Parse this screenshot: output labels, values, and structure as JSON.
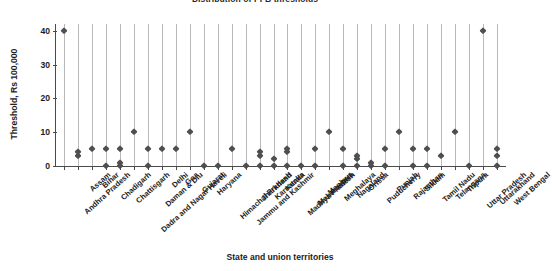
{
  "chart_data": {
    "type": "scatter",
    "title": "Distribution of PFB thresholds",
    "xlabel": "State and union territories",
    "ylabel": "Threshold, Rs 100,000",
    "ylim": [
      0,
      42
    ],
    "yticks": [
      0,
      10,
      20,
      30,
      40
    ],
    "grid": "vertical",
    "legend": "none",
    "marker": "diamond",
    "marker_color": "#4f4f4f",
    "categories": [
      "Andhra Pradesh",
      "Assam",
      "Bihar",
      "Chadigarh",
      "Chattisgarh",
      "Dadra and Nagar Haveli",
      "Daman & Diu",
      "Delhi",
      "Goa",
      "Gujarat",
      "Haryana",
      "Himachal Pradesh",
      "Jammu and Kashmir",
      "Jharkhand",
      "Karnataka",
      "Kerala",
      "Madhya Pradesh",
      "Maharashtra",
      "Manipur",
      "Meghalaya",
      "Nagaland",
      "Orissa",
      "Puducherry",
      "Punjab",
      "Rajasthan",
      "Sikkim",
      "Tamil Nadu",
      "Telangana",
      "Tripura",
      "Uttar Pradesh",
      "Uttarakhand",
      "West Bengal"
    ],
    "points": [
      {
        "category": "Andhra Pradesh",
        "values": [
          40
        ]
      },
      {
        "category": "Assam",
        "values": [
          3,
          4
        ]
      },
      {
        "category": "Bihar",
        "values": [
          5
        ]
      },
      {
        "category": "Chadigarh",
        "values": [
          0,
          5
        ]
      },
      {
        "category": "Chattisgarh",
        "values": [
          0,
          1,
          5
        ]
      },
      {
        "category": "Dadra and Nagar Haveli",
        "values": [
          10
        ]
      },
      {
        "category": "Daman & Diu",
        "values": [
          0,
          5
        ]
      },
      {
        "category": "Delhi",
        "values": [
          5
        ]
      },
      {
        "category": "Goa",
        "values": [
          5
        ]
      },
      {
        "category": "Gujarat",
        "values": [
          10
        ]
      },
      {
        "category": "Haryana",
        "values": [
          0
        ]
      },
      {
        "category": "Himachal Pradesh",
        "values": [
          0
        ]
      },
      {
        "category": "Jammu and Kashmir",
        "values": [
          5
        ]
      },
      {
        "category": "Jharkhand",
        "values": [
          0
        ]
      },
      {
        "category": "Karnataka",
        "values": [
          0,
          3,
          4
        ]
      },
      {
        "category": "Kerala",
        "values": [
          0,
          2
        ]
      },
      {
        "category": "Madhya Pradesh",
        "values": [
          0,
          4,
          5
        ]
      },
      {
        "category": "Maharashtra",
        "values": [
          0
        ]
      },
      {
        "category": "Manipur",
        "values": [
          0,
          5
        ]
      },
      {
        "category": "Meghalaya",
        "values": [
          10
        ]
      },
      {
        "category": "Nagaland",
        "values": [
          0,
          5
        ]
      },
      {
        "category": "Orissa",
        "values": [
          0,
          2,
          3
        ]
      },
      {
        "category": "Puducherry",
        "values": [
          0,
          1
        ]
      },
      {
        "category": "Punjab",
        "values": [
          0,
          5
        ]
      },
      {
        "category": "Rajasthan",
        "values": [
          10
        ]
      },
      {
        "category": "Sikkim",
        "values": [
          0,
          5
        ]
      },
      {
        "category": "Tamil Nadu",
        "values": [
          0,
          5
        ]
      },
      {
        "category": "Telangana",
        "values": [
          3
        ]
      },
      {
        "category": "Tripura",
        "values": [
          10
        ]
      },
      {
        "category": "Uttar Pradesh",
        "values": [
          0
        ]
      },
      {
        "category": "Uttarakhand",
        "values": [
          40
        ]
      },
      {
        "category": "West Bengal",
        "values": [
          0,
          3,
          5
        ]
      }
    ],
    "series_detail": [
      {
        "x": 0,
        "label": "Andhra Pradesh",
        "values": [
          40
        ]
      },
      {
        "x": 1,
        "label": "Assam",
        "values": [
          3,
          4
        ]
      },
      {
        "x": 2,
        "label": "Bihar",
        "values": [
          5
        ]
      },
      {
        "x": 3,
        "label": "Chadigarh",
        "values": [
          0,
          5
        ]
      },
      {
        "x": 4,
        "label": "Chattisgarh",
        "values": [
          0,
          1,
          5
        ]
      },
      {
        "x": 5,
        "label": "Dadra and Nagar Haveli",
        "values": [
          10
        ]
      },
      {
        "x": 6,
        "label": "Daman & Diu",
        "values": [
          0,
          5
        ]
      },
      {
        "x": 7,
        "label": "Delhi",
        "values": [
          5
        ]
      },
      {
        "x": 8,
        "label": "Goa",
        "values": [
          5
        ]
      },
      {
        "x": 9,
        "label": "Gujarat",
        "values": [
          10
        ]
      },
      {
        "x": 10,
        "label": "Haryana",
        "values": [
          0
        ]
      },
      {
        "x": 11,
        "label": "Himachal Pradesh",
        "values": [
          0
        ]
      },
      {
        "x": 12,
        "label": "Jammu and Kashmir",
        "values": [
          5
        ]
      },
      {
        "x": 13,
        "label": "Jharkhand",
        "values": [
          0
        ]
      },
      {
        "x": 14,
        "label": "Karnataka",
        "values": [
          0,
          3,
          4
        ]
      },
      {
        "x": 15,
        "label": "Kerala",
        "values": [
          0,
          2
        ]
      },
      {
        "x": 16,
        "label": "Madhya Pradesh",
        "values": [
          0,
          4,
          5
        ]
      },
      {
        "x": 17,
        "label": "Maharashtra",
        "values": [
          0
        ]
      },
      {
        "x": 18,
        "label": "Manipur",
        "values": [
          0,
          5
        ]
      },
      {
        "x": 19,
        "label": "Meghalaya",
        "values": [
          10
        ]
      },
      {
        "x": 20,
        "label": "Nagaland",
        "values": [
          0,
          5
        ]
      },
      {
        "x": 21,
        "label": "Orissa",
        "values": [
          0,
          2,
          3
        ]
      },
      {
        "x": 22,
        "label": "Puducherry",
        "values": [
          0,
          1
        ]
      },
      {
        "x": 23,
        "label": "Punjab",
        "values": [
          0,
          5
        ]
      },
      {
        "x": 24,
        "label": "Rajasthan",
        "values": [
          10
        ]
      },
      {
        "x": 25,
        "label": "Sikkim",
        "values": [
          0,
          5
        ]
      },
      {
        "x": 26,
        "label": "Tamil Nadu",
        "values": [
          0,
          5
        ]
      },
      {
        "x": 27,
        "label": "Telangana",
        "values": [
          3
        ]
      },
      {
        "x": 28,
        "label": "Tripura",
        "values": [
          10
        ]
      },
      {
        "x": 29,
        "label": "Uttar Pradesh",
        "values": [
          0
        ]
      },
      {
        "x": 30,
        "label": "Uttarakhand",
        "values": [
          40
        ]
      },
      {
        "x": 31,
        "label": "West Bengal",
        "values": [
          0,
          3,
          5
        ]
      }
    ]
  }
}
